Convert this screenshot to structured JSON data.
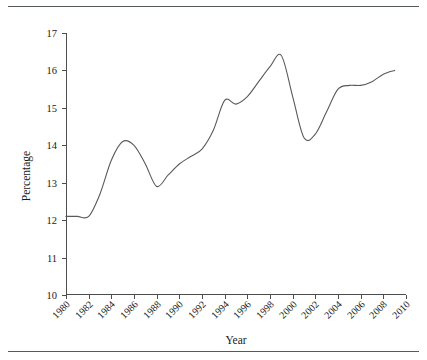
{
  "figure": {
    "caption_fragment": "",
    "background": "#ffffff",
    "line_color": "#5a5a5a",
    "axis_color": "#4d4d4d",
    "rule_color": "#555a5e"
  },
  "chart_data": {
    "type": "line",
    "title": "",
    "xlabel": "Year",
    "ylabel": "Percentage",
    "xlim": [
      1980,
      2010
    ],
    "ylim": [
      10,
      17
    ],
    "grid": false,
    "legend": null,
    "xticks": [
      1980,
      1982,
      1984,
      1986,
      1988,
      1990,
      1992,
      1994,
      1996,
      1998,
      2000,
      2002,
      2004,
      2006,
      2008,
      2010
    ],
    "xtick_labels": [
      "1980",
      "1982",
      "1984",
      "1986",
      "1988",
      "1990",
      "1992",
      "1994",
      "1996",
      "1998",
      "2000",
      "2002",
      "2004",
      "2006",
      "2008",
      "2010"
    ],
    "yticks": [
      10,
      11,
      12,
      13,
      14,
      15,
      16,
      17
    ],
    "ytick_labels": [
      "10",
      "11",
      "12",
      "13",
      "14",
      "15",
      "16",
      "17"
    ],
    "series": [
      {
        "name": "Percentage",
        "x": [
          1980,
          1981,
          1982,
          1983,
          1984,
          1985,
          1986,
          1987,
          1988,
          1989,
          1990,
          1991,
          1992,
          1993,
          1994,
          1995,
          1996,
          1997,
          1998,
          1999,
          2000,
          2001,
          2002,
          2003,
          2004,
          2005,
          2006,
          2007,
          2008,
          2009
        ],
        "values": [
          12.1,
          12.1,
          12.1,
          12.7,
          13.6,
          14.1,
          14.0,
          13.5,
          12.9,
          13.2,
          13.5,
          13.7,
          13.9,
          14.4,
          15.2,
          15.1,
          15.3,
          15.7,
          16.1,
          16.4,
          15.3,
          14.2,
          14.3,
          14.9,
          15.5,
          15.6,
          15.6,
          15.7,
          15.9,
          16.0
        ]
      }
    ]
  }
}
